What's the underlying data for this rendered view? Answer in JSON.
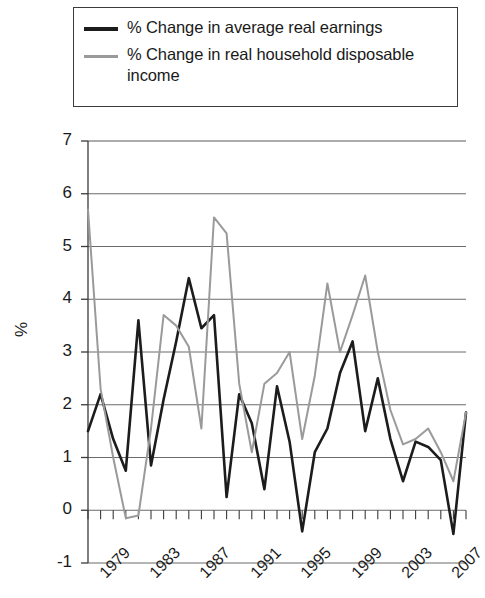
{
  "legend": {
    "items": [
      {
        "label": "% Change in average real earnings",
        "color": "#1c1c1c",
        "key": "earnings"
      },
      {
        "label": "% Change in real household disposable income",
        "color": "#9a9a9a",
        "key": "income"
      }
    ]
  },
  "axis": {
    "y_label": "%",
    "y_ticks": [
      "7",
      "6",
      "5",
      "4",
      "3",
      "2",
      "1",
      "0",
      "-1"
    ],
    "x_ticks": [
      "1979",
      "1983",
      "1987",
      "1991",
      "1995",
      "1999",
      "2003",
      "2007"
    ]
  },
  "chart_data": {
    "type": "line",
    "title": "",
    "xlabel": "",
    "ylabel": "%",
    "ylim": [
      -1,
      7
    ],
    "xlim": [
      1978,
      2008
    ],
    "grid": true,
    "legend_position": "top",
    "x": [
      1978,
      1979,
      1980,
      1981,
      1982,
      1983,
      1984,
      1985,
      1986,
      1987,
      1988,
      1989,
      1990,
      1991,
      1992,
      1993,
      1994,
      1995,
      1996,
      1997,
      1998,
      1999,
      2000,
      2001,
      2002,
      2003,
      2004,
      2005,
      2006,
      2007,
      2008
    ],
    "series": [
      {
        "name": "% Change in average real earnings",
        "color": "#1c1c1c",
        "values": [
          1.5,
          2.2,
          1.35,
          0.75,
          3.6,
          0.85,
          2.1,
          3.2,
          4.4,
          3.45,
          3.7,
          0.25,
          2.2,
          1.65,
          0.4,
          2.35,
          1.3,
          -0.4,
          1.1,
          1.55,
          2.6,
          3.2,
          1.5,
          2.5,
          1.35,
          0.55,
          1.3,
          1.2,
          0.95,
          -0.45,
          1.85
        ]
      },
      {
        "name": "% Change in real household disposable income",
        "color": "#9a9a9a",
        "values": [
          5.7,
          2.3,
          1.0,
          -0.15,
          -0.1,
          1.55,
          3.7,
          3.5,
          3.1,
          1.55,
          5.55,
          5.25,
          2.4,
          1.1,
          2.4,
          2.6,
          3.0,
          1.35,
          2.55,
          4.3,
          3.0,
          3.7,
          4.45,
          3.0,
          1.9,
          1.25,
          1.35,
          1.55,
          1.1,
          0.55,
          1.85
        ]
      }
    ]
  }
}
